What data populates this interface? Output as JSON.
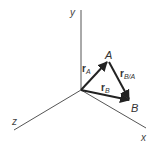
{
  "diagram": {
    "axes": {
      "x": {
        "label": "x"
      },
      "y": {
        "label": "y"
      },
      "z": {
        "label": "z"
      }
    },
    "points": {
      "A": {
        "label": "A"
      },
      "B": {
        "label": "B"
      }
    },
    "vectors": {
      "rA": {
        "symbol": "r",
        "subscript": "A"
      },
      "rB": {
        "symbol": "r",
        "subscript": "B"
      },
      "rBA": {
        "symbol": "r",
        "subscript": "B/A"
      }
    },
    "colors": {
      "axis": "#555555",
      "vector": "#222222",
      "text": "#333333",
      "background": "#ffffff"
    }
  }
}
